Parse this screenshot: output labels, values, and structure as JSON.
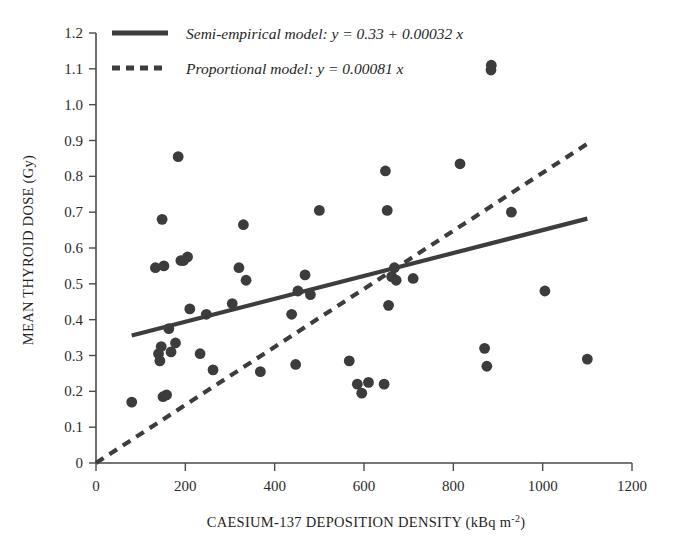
{
  "chart_data": {
    "type": "scatter",
    "title": "",
    "xlabel": "CAESIUM-137 DEPOSITION DENSITY (kBq m-2)",
    "xlabel_main": "CAESIUM-137 DEPOSITION DENSITY (kBq m",
    "xlabel_sup": "-2",
    "xlabel_tail": ")",
    "ylabel": "MEAN THYROID DOSE (Gy)",
    "xlim": [
      0,
      1200
    ],
    "ylim": [
      0,
      1.2
    ],
    "grid": false,
    "legend_position": "top-left-inside",
    "xticks": [
      0,
      200,
      400,
      600,
      800,
      1000,
      1200
    ],
    "xtick_labels": [
      "0",
      "200",
      "400",
      "600",
      "800",
      "1000",
      "1200"
    ],
    "yticks": [
      0,
      0.1,
      0.2,
      0.3,
      0.4,
      0.5,
      0.6,
      0.7,
      0.8,
      0.9,
      1.0,
      1.1,
      1.2
    ],
    "ytick_labels": [
      "0",
      "0.1",
      "0.2",
      "0.3",
      "0.4",
      "0.5",
      "0.6",
      "0.7",
      "0.8",
      "0.9",
      "1.0",
      "1.1",
      "1.2"
    ],
    "marker_color": "#3c3c3c",
    "line_color": "#3d3d3d",
    "axis_color": "#4a4a4a",
    "series": [
      {
        "name": "observations",
        "type": "scatter",
        "points": [
          [
            80,
            0.17
          ],
          [
            133,
            0.545
          ],
          [
            140,
            0.305
          ],
          [
            143,
            0.285
          ],
          [
            146,
            0.325
          ],
          [
            148,
            0.68
          ],
          [
            150,
            0.185
          ],
          [
            152,
            0.55
          ],
          [
            158,
            0.19
          ],
          [
            163,
            0.375
          ],
          [
            168,
            0.31
          ],
          [
            178,
            0.335
          ],
          [
            184,
            0.855
          ],
          [
            190,
            0.565
          ],
          [
            196,
            0.565
          ],
          [
            205,
            0.575
          ],
          [
            210,
            0.43
          ],
          [
            233,
            0.305
          ],
          [
            247,
            0.415
          ],
          [
            262,
            0.26
          ],
          [
            305,
            0.445
          ],
          [
            320,
            0.545
          ],
          [
            330,
            0.665
          ],
          [
            336,
            0.51
          ],
          [
            368,
            0.255
          ],
          [
            438,
            0.415
          ],
          [
            447,
            0.275
          ],
          [
            452,
            0.48
          ],
          [
            468,
            0.525
          ],
          [
            480,
            0.47
          ],
          [
            500,
            0.705
          ],
          [
            567,
            0.285
          ],
          [
            585,
            0.22
          ],
          [
            595,
            0.195
          ],
          [
            610,
            0.225
          ],
          [
            645,
            0.22
          ],
          [
            648,
            0.815
          ],
          [
            652,
            0.705
          ],
          [
            655,
            0.44
          ],
          [
            662,
            0.52
          ],
          [
            668,
            0.545
          ],
          [
            672,
            0.51
          ],
          [
            710,
            0.515
          ],
          [
            815,
            0.835
          ],
          [
            870,
            0.32
          ],
          [
            875,
            0.27
          ],
          [
            885,
            1.11
          ],
          [
            930,
            0.7
          ],
          [
            1005,
            0.48
          ],
          [
            1100,
            0.29
          ]
        ]
      },
      {
        "name": "Semi-empirical model",
        "type": "line",
        "style": "solid",
        "equation": "y = 0.33 + 0.00032 x",
        "intercept": 0.33,
        "slope": 0.00032,
        "x_start": 80,
        "x_end": 1100
      },
      {
        "name": "Proportional model",
        "type": "line",
        "style": "dashed",
        "equation": "y = 0.00081 x",
        "intercept": 0,
        "slope": 0.00081,
        "x_start": 0,
        "x_end": 1100
      }
    ]
  },
  "legend": {
    "entries": [
      {
        "label": "Semi-empirical model: y = 0.33 + 0.00032 x",
        "style": "solid",
        "icon": "solid-line-icon"
      },
      {
        "label": "Proportional model: y = 0.00081 x",
        "style": "dashed",
        "icon": "dashed-line-icon"
      }
    ]
  }
}
